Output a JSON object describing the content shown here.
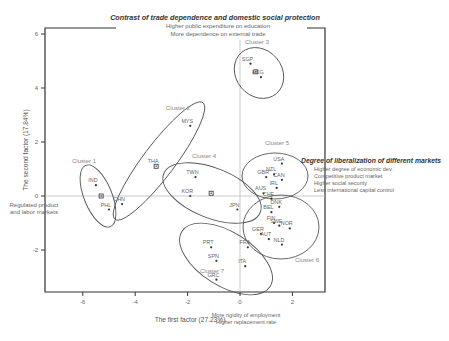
{
  "chart_data": {
    "type": "scatter",
    "title": "Contrast of trade dependence and domestic social protection",
    "top_annotation": [
      "Higher public expenditure on education",
      "More dependence on external trade"
    ],
    "right_annotation_title": "Degree of liberalization of different markets",
    "right_annotation": [
      "Higher degree of economic dev.",
      "Competitive product market",
      "Higher social security",
      "Less international capital control"
    ],
    "left_annotation": [
      "Regulated product",
      "and labor markets"
    ],
    "bottom_annotation": [
      "More rigidity of employment",
      "Higher replacement rate"
    ],
    "xlabel": "The first factor  (27.23%)",
    "ylabel": "The second factor (17.84%)",
    "xlim": [
      -7.5,
      3.25
    ],
    "ylim": [
      -3.5,
      6.2
    ],
    "xticks": [
      -6,
      -4,
      -2,
      0,
      2
    ],
    "yticks": [
      -2,
      0,
      2,
      4,
      6
    ],
    "grid": false,
    "reference_lines": {
      "x": 0,
      "y": 0
    },
    "points": [
      {
        "label": "IND",
        "x": -5.5,
        "y": 0.4,
        "cluster": 1
      },
      {
        "label": "PHL",
        "x": -5.0,
        "y": -0.5,
        "cluster": 1
      },
      {
        "label": "",
        "x": -5.3,
        "y": 0.0,
        "cluster": 1,
        "marker": "centroid"
      },
      {
        "label": "CHN",
        "x": -4.5,
        "y": -0.3,
        "cluster": 2
      },
      {
        "label": "THA",
        "x": -3.2,
        "y": 1.1,
        "cluster": 2,
        "marker": "centroid"
      },
      {
        "label": "MYS",
        "x": -1.9,
        "y": 2.6,
        "cluster": 2
      },
      {
        "label": "SGP",
        "x": 0.4,
        "y": 4.9,
        "cluster": 3
      },
      {
        "label": "",
        "x": 0.6,
        "y": 4.6,
        "cluster": 3,
        "marker": "centroid"
      },
      {
        "label": "HKG",
        "x": 0.8,
        "y": 4.4,
        "cluster": 3
      },
      {
        "label": "TWN",
        "x": -1.7,
        "y": 0.7,
        "cluster": 4
      },
      {
        "label": "KOR",
        "x": -1.9,
        "y": 0.0,
        "cluster": 4
      },
      {
        "label": "",
        "x": -1.1,
        "y": 0.1,
        "cluster": 4,
        "marker": "centroid"
      },
      {
        "label": "JPN",
        "x": -0.1,
        "y": -0.5,
        "cluster": 4
      },
      {
        "label": "USA",
        "x": 1.6,
        "y": 1.2,
        "cluster": 5
      },
      {
        "label": "GBR",
        "x": 1.0,
        "y": 0.7,
        "cluster": 5
      },
      {
        "label": "NZL",
        "x": 1.3,
        "y": 0.8,
        "cluster": 5
      },
      {
        "label": "CAN",
        "x": 1.6,
        "y": 0.6,
        "cluster": 5
      },
      {
        "label": "IRL",
        "x": 1.4,
        "y": 0.3,
        "cluster": 5
      },
      {
        "label": "AUS",
        "x": 0.9,
        "y": 0.1,
        "cluster": 5
      },
      {
        "label": "CHE",
        "x": 1.2,
        "y": -0.1,
        "cluster": 5
      },
      {
        "label": "BEL",
        "x": 1.2,
        "y": -0.6,
        "cluster": 6
      },
      {
        "label": "DNK",
        "x": 1.5,
        "y": -0.4,
        "cluster": 6
      },
      {
        "label": "FIN",
        "x": 1.3,
        "y": -1.0,
        "cluster": 6
      },
      {
        "label": "SWE",
        "x": 1.5,
        "y": -1.1,
        "cluster": 6
      },
      {
        "label": "NOR",
        "x": 1.9,
        "y": -1.2,
        "cluster": 6
      },
      {
        "label": "GER",
        "x": 0.8,
        "y": -1.4,
        "cluster": 6
      },
      {
        "label": "AUT",
        "x": 1.1,
        "y": -1.6,
        "cluster": 6
      },
      {
        "label": "NLD",
        "x": 1.6,
        "y": -1.8,
        "cluster": 6
      },
      {
        "label": "FRA",
        "x": 0.3,
        "y": -1.9,
        "cluster": 7
      },
      {
        "label": "PRT",
        "x": -1.1,
        "y": -1.9,
        "cluster": 7
      },
      {
        "label": "SPN",
        "x": -0.9,
        "y": -2.4,
        "cluster": 7
      },
      {
        "label": "ITA",
        "x": 0.2,
        "y": -2.6,
        "cluster": 7
      },
      {
        "label": "GRC",
        "x": -0.9,
        "y": -3.1,
        "cluster": 7
      }
    ],
    "clusters": [
      {
        "name": "Cluster 1",
        "id": 1
      },
      {
        "name": "Cluster 2",
        "id": 2
      },
      {
        "name": "Cluster 3",
        "id": 3
      },
      {
        "name": "Cluster 4",
        "id": 4
      },
      {
        "name": "Cluster 5",
        "id": 5
      },
      {
        "name": "Cluster 6",
        "id": 6
      },
      {
        "name": "Cluster 7",
        "id": 7
      }
    ],
    "colors": {
      "frame": "#333333",
      "text": "#555555",
      "cluster_label": "#888888",
      "refline": "#bbbbbb",
      "ellipse": "#555555"
    }
  }
}
